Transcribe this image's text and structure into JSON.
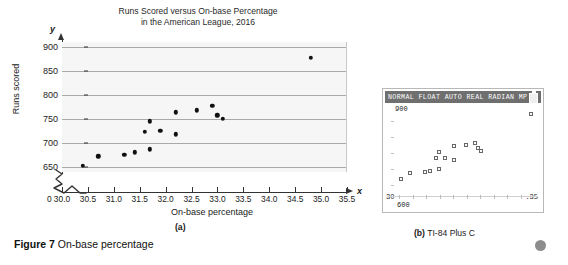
{
  "figure": {
    "caption_lead": "Figure 7",
    "caption_text": "On-base percentage",
    "panel_a_label": "(a)",
    "panel_b_label_lead": "(b)",
    "panel_b_label_text": "TI-84 Plus C"
  },
  "calculator": {
    "status_bar": "NORMAL FLOAT AUTO REAL RADIAN MP",
    "battery_icon": "battery-icon",
    "y_max_label": "900",
    "y_min_label": "600",
    "x_min_label": "30",
    "x_max_label": ".35"
  },
  "chart_data": {
    "type": "scatter",
    "title": "Runs Scored versus On-base Percentage",
    "subtitle": "in the American League, 2016",
    "title_line1": "Runs Scored versus On-base Percentage",
    "title_line2": "in the American League, 2016",
    "xlabel": "On-base percentage",
    "ylabel": "Runs scored",
    "x_variable": "x",
    "y_variable": "y",
    "origin_label": "0",
    "xlim": [
      30.0,
      35.5
    ],
    "ylim": [
      640,
      910
    ],
    "grid": true,
    "axis_break": true,
    "xticks": [
      30.0,
      30.5,
      31.0,
      31.5,
      32.0,
      32.5,
      33.0,
      33.5,
      34.0,
      34.5,
      35.0,
      35.5
    ],
    "xticklabels": [
      "30.0",
      "30.5",
      "31.0",
      "31.5",
      "32.0",
      "32.5",
      "33.0",
      "33.5",
      "34.0",
      "34.5",
      "35.0",
      "35.5"
    ],
    "yticks": [
      650,
      700,
      750,
      800,
      850,
      900
    ],
    "yticklabels": [
      "650",
      "700",
      "750",
      "800",
      "850",
      "900"
    ],
    "points": [
      {
        "x": 30.4,
        "y": 653
      },
      {
        "x": 30.7,
        "y": 673
      },
      {
        "x": 31.2,
        "y": 676
      },
      {
        "x": 31.4,
        "y": 681
      },
      {
        "x": 31.7,
        "y": 687
      },
      {
        "x": 31.6,
        "y": 723
      },
      {
        "x": 31.7,
        "y": 745
      },
      {
        "x": 31.9,
        "y": 725
      },
      {
        "x": 32.2,
        "y": 718
      },
      {
        "x": 32.2,
        "y": 764
      },
      {
        "x": 32.6,
        "y": 768
      },
      {
        "x": 32.9,
        "y": 777
      },
      {
        "x": 33.0,
        "y": 758
      },
      {
        "x": 33.1,
        "y": 750
      },
      {
        "x": 34.8,
        "y": 877
      }
    ],
    "calculator_points": [
      {
        "x": 30.4,
        "y": 653
      },
      {
        "x": 30.7,
        "y": 673
      },
      {
        "x": 31.2,
        "y": 676
      },
      {
        "x": 31.4,
        "y": 681
      },
      {
        "x": 31.7,
        "y": 687
      },
      {
        "x": 31.6,
        "y": 723
      },
      {
        "x": 31.7,
        "y": 745
      },
      {
        "x": 31.9,
        "y": 725
      },
      {
        "x": 32.2,
        "y": 718
      },
      {
        "x": 32.2,
        "y": 764
      },
      {
        "x": 32.6,
        "y": 768
      },
      {
        "x": 32.9,
        "y": 777
      },
      {
        "x": 33.0,
        "y": 758
      },
      {
        "x": 33.1,
        "y": 750
      },
      {
        "x": 34.8,
        "y": 877
      }
    ]
  }
}
